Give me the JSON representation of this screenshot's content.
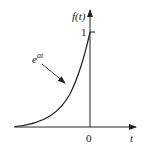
{
  "figure": {
    "y_axis_label": "f(t)",
    "x_axis_label": "t",
    "y_tick_label": "1",
    "x_origin_label": "0",
    "curve_label_base": "e",
    "curve_label_exponent": "at",
    "colors": {
      "stroke": "#222222",
      "background": "#ffffff"
    }
  }
}
